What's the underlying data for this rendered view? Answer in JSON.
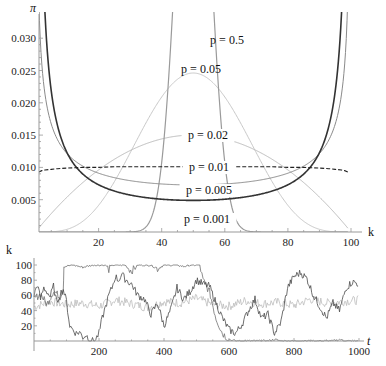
{
  "chart_data": [
    {
      "type": "line",
      "title": "",
      "xlabel": "k",
      "ylabel": "π",
      "xlim": [
        1,
        99
      ],
      "ylim": [
        0,
        0.032
      ],
      "grid": false,
      "legend": "inline labels",
      "x_ticks": [
        20,
        40,
        60,
        80,
        100
      ],
      "y_ticks": [
        0.005,
        0.01,
        0.015,
        0.02,
        0.025,
        0.03
      ],
      "y_tick_labels": [
        "0.005",
        "0.010",
        "0.015",
        "0.020",
        "0.025",
        "0.030"
      ],
      "x": [
        1,
        2,
        3,
        5,
        7,
        10,
        15,
        20,
        25,
        30,
        35,
        38,
        40,
        42,
        44,
        46,
        48,
        50,
        52,
        54,
        56,
        58,
        60,
        62,
        65,
        70,
        75,
        80,
        85,
        90,
        93,
        95,
        97,
        98,
        99
      ],
      "series": [
        {
          "name": "p = 0.001",
          "label": "p = 0.001",
          "color": "#333333",
          "width": 1.6,
          "dash": "",
          "theta": 0.1,
          "values": [
            0.0322,
            0.0171,
            0.0118,
            0.0079,
            0.0058,
            0.0044,
            0.0033,
            0.0026,
            0.0023,
            0.0021,
            0.0019,
            0.0019,
            0.0018,
            0.0018,
            0.0018,
            0.0018,
            0.0018,
            0.0018,
            0.0018,
            0.0018,
            0.0018,
            0.0018,
            0.0018,
            0.0018,
            0.0019,
            0.0021,
            0.0023,
            0.0026,
            0.0033,
            0.0044,
            0.0058,
            0.0079,
            0.0118,
            0.0171,
            0.0322
          ]
        },
        {
          "name": "p = 0.005",
          "label": "p = 0.005",
          "color": "#8a8a8a",
          "width": 1.0,
          "dash": "",
          "theta": 0.5,
          "values": [
            0.032,
            0.0227,
            0.0187,
            0.0146,
            0.0124,
            0.0106,
            0.0089,
            0.008,
            0.0074,
            0.0069,
            0.0067,
            0.0066,
            0.0065,
            0.0064,
            0.0064,
            0.0064,
            0.0064,
            0.0064,
            0.0064,
            0.0064,
            0.0064,
            0.0064,
            0.0065,
            0.0066,
            0.0067,
            0.0069,
            0.0074,
            0.008,
            0.0089,
            0.0106,
            0.0125,
            0.0146,
            0.0187,
            0.0227,
            0.032
          ]
        },
        {
          "name": "p = 0.01",
          "label": "p = 0.01",
          "color": "#222222",
          "width": 1.1,
          "dash": "4,2",
          "theta": 1.0,
          "values": [
            0.0093,
            0.0095,
            0.0096,
            0.0097,
            0.0098,
            0.0099,
            0.01,
            0.01,
            0.0101,
            0.0101,
            0.0101,
            0.0101,
            0.0101,
            0.0101,
            0.0101,
            0.0101,
            0.0101,
            0.0101,
            0.0101,
            0.0101,
            0.0101,
            0.0101,
            0.0101,
            0.0101,
            0.0101,
            0.0101,
            0.0101,
            0.01,
            0.01,
            0.0099,
            0.0098,
            0.0097,
            0.0096,
            0.0095,
            0.0093
          ]
        },
        {
          "name": "p = 0.02",
          "label": "p = 0.02",
          "color": "#bdbdbd",
          "width": 1.0,
          "dash": "",
          "theta": 2.0,
          "values": [
            0.0006,
            0.0012,
            0.0017,
            0.0029,
            0.0039,
            0.0054,
            0.0077,
            0.0096,
            0.0113,
            0.0126,
            0.0137,
            0.0141,
            0.0144,
            0.0146,
            0.0148,
            0.0149,
            0.015,
            0.015,
            0.015,
            0.0149,
            0.0148,
            0.0146,
            0.0144,
            0.0141,
            0.0137,
            0.0126,
            0.0113,
            0.0096,
            0.0077,
            0.0054,
            0.0039,
            0.0029,
            0.0017,
            0.0012,
            0.0006
          ]
        },
        {
          "name": "p = 0.05",
          "label": "p = 0.05",
          "color": "#c8c8c8",
          "width": 1.0,
          "dash": "",
          "theta": 5.0,
          "values": [
            0.0,
            0.0,
            0.0,
            0.0,
            0.0,
            0.0004,
            0.0017,
            0.0041,
            0.0077,
            0.0123,
            0.0168,
            0.0194,
            0.0209,
            0.0222,
            0.0233,
            0.024,
            0.0245,
            0.0246,
            0.0245,
            0.024,
            0.0233,
            0.0222,
            0.0209,
            0.0194,
            0.0168,
            0.0123,
            0.0077,
            0.0041,
            0.0017,
            0.0004,
            0.0001,
            0.0,
            0.0,
            0.0,
            0.0
          ]
        },
        {
          "name": "p = 0.5",
          "label": "p = 0.5",
          "color": "#9a9a9a",
          "width": 1.2,
          "dash": "",
          "theta": 50.0,
          "values": [
            0,
            0,
            0,
            0,
            0,
            0,
            0,
            0,
            0,
            0.0,
            0.0008,
            0.0045,
            0.0108,
            0.0222,
            0.0386,
            0.0571,
            0.0733,
            0.0796,
            0.0733,
            0.0571,
            0.0386,
            0.0222,
            0.0108,
            0.0045,
            0.0008,
            0.0,
            0,
            0,
            0,
            0,
            0,
            0,
            0,
            0,
            0
          ]
        }
      ],
      "annotations": [
        {
          "text": "p = 0.5",
          "x": 61,
          "y": 0.0295
        },
        {
          "text": "p = 0.05",
          "x": 50,
          "y": 0.0245
        },
        {
          "text": "p = 0.02",
          "x": 60,
          "y": 0.0149
        },
        {
          "text": "p = 0.01",
          "x": 59,
          "y": 0.0101
        },
        {
          "text": "p = 0.005",
          "x": 60,
          "y": 0.0072
        },
        {
          "text": "p = 0.001",
          "x": 59,
          "y": 0.0018
        }
      ]
    },
    {
      "type": "line",
      "title": "",
      "xlabel": "t",
      "ylabel": "k",
      "xlim": [
        0,
        1000
      ],
      "ylim": [
        0,
        100
      ],
      "grid": false,
      "x_ticks": [
        200,
        400,
        600,
        800,
        1000
      ],
      "y_ticks": [
        20,
        40,
        60,
        80,
        100
      ],
      "series": [
        {
          "name": "trajectory A (sticks at 100)",
          "color": "#707070",
          "t": [
            0,
            20,
            40,
            60,
            80,
            90,
            92,
            120,
            150,
            180,
            200,
            220,
            230,
            240,
            260,
            280,
            300,
            320,
            340,
            360,
            380,
            400,
            420,
            440,
            460,
            480,
            500,
            510,
            520,
            540,
            560,
            580,
            600,
            620,
            640,
            660,
            680,
            700,
            720,
            740,
            760,
            780,
            800,
            820,
            840,
            860,
            880,
            900,
            920,
            940,
            960,
            980,
            1000
          ],
          "values": [
            55,
            62,
            48,
            66,
            58,
            70,
            98,
            100,
            97,
            100,
            100,
            100,
            94,
            100,
            100,
            100,
            92,
            100,
            100,
            100,
            95,
            100,
            100,
            100,
            98,
            100,
            100,
            100,
            80,
            65,
            30,
            10,
            2,
            0,
            0,
            0,
            0,
            0,
            0,
            2,
            0,
            0,
            0,
            0,
            0,
            0,
            0,
            0,
            0,
            2,
            0,
            0,
            0
          ]
        },
        {
          "name": "trajectory B (wanders)",
          "color": "#4a4a4a",
          "t": [
            0,
            10,
            20,
            30,
            40,
            50,
            60,
            70,
            80,
            90,
            100,
            110,
            120,
            130,
            140,
            150,
            160,
            170,
            180,
            190,
            200,
            210,
            220,
            230,
            240,
            250,
            260,
            270,
            280,
            290,
            300,
            320,
            340,
            360,
            380,
            400,
            420,
            440,
            460,
            480,
            500,
            520,
            540,
            560,
            580,
            600,
            620,
            640,
            660,
            680,
            700,
            720,
            740,
            760,
            780,
            800,
            820,
            840,
            860,
            880,
            900,
            920,
            940,
            960,
            980,
            1000
          ],
          "values": [
            60,
            75,
            55,
            70,
            65,
            58,
            72,
            50,
            62,
            68,
            52,
            20,
            15,
            10,
            12,
            5,
            8,
            2,
            0,
            2,
            10,
            30,
            45,
            60,
            70,
            85,
            80,
            88,
            82,
            78,
            75,
            60,
            55,
            35,
            50,
            20,
            40,
            70,
            55,
            65,
            80,
            75,
            72,
            50,
            30,
            15,
            10,
            22,
            40,
            55,
            30,
            35,
            10,
            25,
            70,
            85,
            90,
            82,
            60,
            45,
            30,
            50,
            40,
            70,
            78,
            75
          ]
        },
        {
          "name": "trajectory C (p = 0.5, stays near 50)",
          "color": "#bdbdbd",
          "t": [
            0,
            50,
            100,
            150,
            200,
            250,
            300,
            350,
            400,
            450,
            500,
            550,
            600,
            650,
            700,
            750,
            800,
            850,
            900,
            950,
            1000
          ],
          "values": [
            45,
            52,
            48,
            50,
            46,
            54,
            49,
            44,
            52,
            50,
            56,
            48,
            46,
            53,
            49,
            51,
            47,
            55,
            50,
            52,
            54
          ]
        }
      ]
    }
  ],
  "axes": {
    "top": {
      "ylabel": "π",
      "xlabel": "k"
    },
    "bottom": {
      "ylabel": "k",
      "xlabel": "t"
    }
  }
}
